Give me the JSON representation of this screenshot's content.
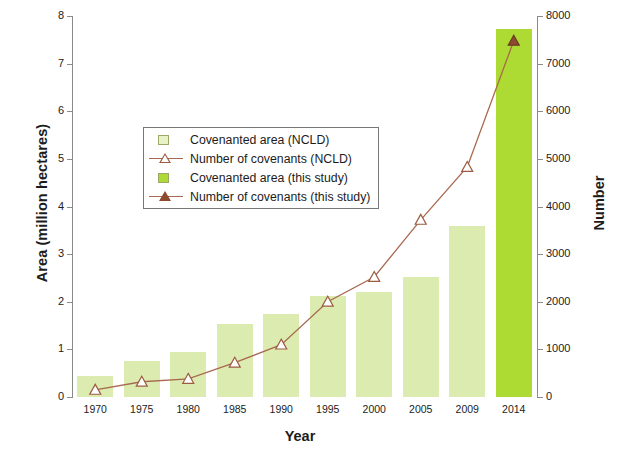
{
  "chart_data": {
    "type": "bar",
    "title": "",
    "xlabel": "Year",
    "ylabel": "Area (million hectares)",
    "y2label": "Number",
    "categories": [
      "1970",
      "1975",
      "1980",
      "1985",
      "1990",
      "1995",
      "2000",
      "2005",
      "2009",
      "2014"
    ],
    "ylim": [
      0,
      8
    ],
    "y2lim": [
      0,
      8000
    ],
    "yticks": [
      "0",
      "1",
      "2",
      "3",
      "4",
      "5",
      "6",
      "7",
      "8"
    ],
    "y2ticks": [
      "0",
      "1000",
      "2000",
      "3000",
      "4000",
      "5000",
      "6000",
      "7000",
      "8000"
    ],
    "grid": false,
    "legend_position": "upper-left-inside",
    "series": [
      {
        "name": "Covenanted area (NCLD)",
        "kind": "bar",
        "axis": "left",
        "color": "#dcecb0",
        "values": [
          0.44,
          0.75,
          0.95,
          1.53,
          1.75,
          2.13,
          2.2,
          2.53,
          3.6,
          null
        ]
      },
      {
        "name": "Number of covenants (NCLD)",
        "kind": "line",
        "axis": "right",
        "color": "#a8694f",
        "marker": "open-triangle",
        "values": [
          150,
          320,
          380,
          720,
          1100,
          2000,
          2520,
          3720,
          4830,
          null
        ]
      },
      {
        "name": "Covenanted area (this study)",
        "kind": "bar",
        "axis": "left",
        "color": "#aedb33",
        "values": [
          null,
          null,
          null,
          null,
          null,
          null,
          null,
          null,
          null,
          7.72
        ]
      },
      {
        "name": "Number of covenants (this study)",
        "kind": "line",
        "axis": "right",
        "color": "#8c4a2f",
        "marker": "filled-triangle",
        "values": [
          null,
          null,
          null,
          null,
          null,
          null,
          null,
          null,
          null,
          7480
        ]
      }
    ]
  },
  "axes": {
    "left_label": "Area (million hectares)",
    "right_label": "Number",
    "x_label": "Year"
  },
  "legend": {
    "items": [
      {
        "label": "Covenanted area (NCLD)",
        "key": "pale-square"
      },
      {
        "label": "Number of covenants (NCLD)",
        "key": "open-triangle-line"
      },
      {
        "label": "Covenanted area (this study)",
        "key": "bright-square"
      },
      {
        "label": "Number of covenants (this study)",
        "key": "filled-triangle-line"
      }
    ]
  }
}
